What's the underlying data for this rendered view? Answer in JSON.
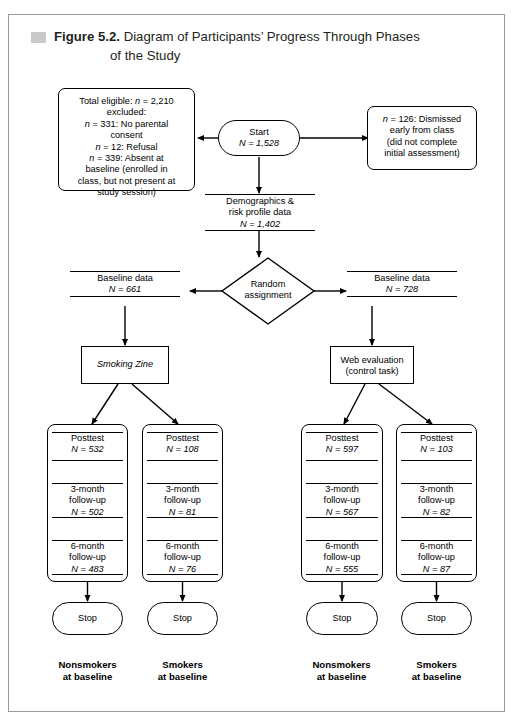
{
  "figure": {
    "number": "Figure 5.2.",
    "title_line1": "Diagram of Participants’ Progress Through Phases",
    "title_line2": "of the Study",
    "marker_color": "#c9c9c9",
    "frame_color": "#9b9b9b"
  },
  "nodes": {
    "excluded": {
      "name": "excluded-box",
      "line1": "Total eligible: n = 2,210",
      "line2": "excluded:",
      "line3": "n = 331: No parental",
      "line4": "consent",
      "line5": "n = 12: Refusal",
      "line6": "n = 339: Absent at",
      "line7": "baseline (enrolled in",
      "line8": "class, but not present at",
      "line9": "study session)"
    },
    "start": {
      "label": "Start",
      "n": "N = 1,528"
    },
    "dismissed": {
      "line1": "n = 126: Dismissed",
      "line2": "early from class",
      "line3": "(did not complete",
      "line4": "initial assessment)"
    },
    "demographics": {
      "line1": "Demographics &",
      "line2": "risk profile data",
      "n": "N = 1,402"
    },
    "random": {
      "line1": "Random",
      "line2": "assignment"
    },
    "baseline_left": {
      "label": "Baseline data",
      "n": "N = 661"
    },
    "baseline_right": {
      "label": "Baseline data",
      "n": "N = 728"
    },
    "intervention": {
      "label": "Smoking Zine"
    },
    "control": {
      "line1": "Web evaluation",
      "line2": "(control task)"
    },
    "stop": {
      "label": "Stop"
    }
  },
  "columns": [
    {
      "id": "col-nonsmokers-intervention",
      "posttest_label": "Posttest",
      "posttest_n": "N = 532",
      "m3_line1": "3-month",
      "m3_line2": "follow-up",
      "m3_n": "N = 502",
      "m6_line1": "6-month",
      "m6_line2": "follow-up",
      "m6_n": "N = 483",
      "stop": "Stop",
      "bottom_line1": "Nonsmokers",
      "bottom_line2": "at baseline"
    },
    {
      "id": "col-smokers-intervention",
      "posttest_label": "Posttest",
      "posttest_n": "N = 108",
      "m3_line1": "3-month",
      "m3_line2": "follow-up",
      "m3_n": "N = 81",
      "m6_line1": "6-month",
      "m6_line2": "follow-up",
      "m6_n": "N = 76",
      "stop": "Stop",
      "bottom_line1": "Smokers",
      "bottom_line2": "at baseline"
    },
    {
      "id": "col-nonsmokers-control",
      "posttest_label": "Posttest",
      "posttest_n": "N = 597",
      "m3_line1": "3-month",
      "m3_line2": "follow-up",
      "m3_n": "N = 567",
      "m6_line1": "6-month",
      "m6_line2": "follow-up",
      "m6_n": "N = 555",
      "stop": "Stop",
      "bottom_line1": "Nonsmokers",
      "bottom_line2": "at baseline"
    },
    {
      "id": "col-smokers-control",
      "posttest_label": "Posttest",
      "posttest_n": "N = 103",
      "m3_line1": "3-month",
      "m3_line2": "follow-up",
      "m3_n": "N = 82",
      "m6_line1": "6-month",
      "m6_line2": "follow-up",
      "m6_n": "N = 87",
      "stop": "Stop",
      "bottom_line1": "Smokers",
      "bottom_line2": "at baseline"
    }
  ]
}
